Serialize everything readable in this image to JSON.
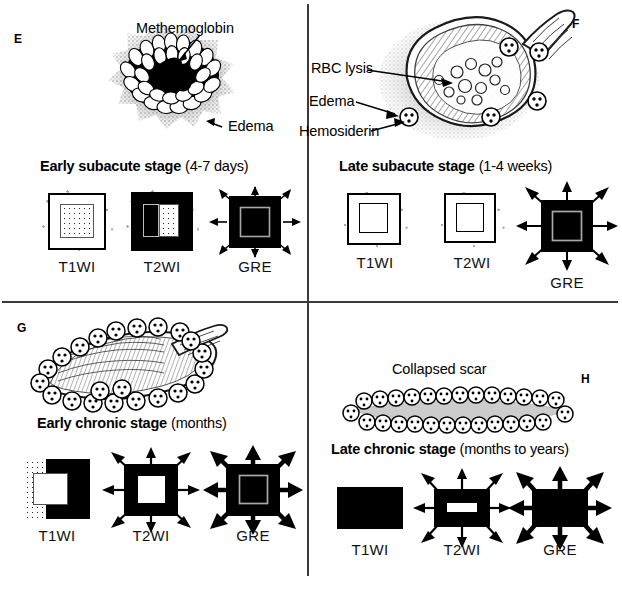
{
  "figure": {
    "panels": [
      {
        "letter": "E",
        "stage_bold": "Early subacute stage",
        "stage_light": "(4-7 days)",
        "annotations": [
          {
            "name": "methemoglobin",
            "text": "Methemoglobin"
          },
          {
            "name": "edema",
            "text": "Edema"
          }
        ],
        "sequences": [
          {
            "label": "T1WI",
            "appearance": "bright-core-dotted-with-edema-halo"
          },
          {
            "label": "T2WI",
            "appearance": "dark-with-bright-rim-and-edema-halo"
          },
          {
            "label": "GRE",
            "appearance": "black-square-with-grey-inner-thin-arrows"
          }
        ]
      },
      {
        "letter": "F",
        "stage_bold": "Late subacute stage",
        "stage_light": "(1-4 weeks)",
        "annotations": [
          {
            "name": "rbc-lysis",
            "text": "RBC lysis"
          },
          {
            "name": "edema",
            "text": "Edema"
          },
          {
            "name": "hemosiderin",
            "text": "Hemosiderin"
          }
        ],
        "sequences": [
          {
            "label": "T1WI",
            "appearance": "white-square-outlined-inner-square-edema-halo"
          },
          {
            "label": "T2WI",
            "appearance": "white-square-outlined-inner-square-edema-halo"
          },
          {
            "label": "GRE",
            "appearance": "black-square-grey-inner-thin-arrows"
          }
        ]
      },
      {
        "letter": "G",
        "stage_bold": "Early chronic stage",
        "stage_light": "(months)",
        "annotations": [],
        "sequences": [
          {
            "label": "T1WI",
            "appearance": "half-dotted-half-black-white-core"
          },
          {
            "label": "T2WI",
            "appearance": "black-square-white-core-thin-arrows"
          },
          {
            "label": "GRE",
            "appearance": "black-square-grey-core-bold-arrows"
          }
        ]
      },
      {
        "letter": "H",
        "stage_bold": "Late chronic stage",
        "stage_light": "(months to years)",
        "annotations": [
          {
            "name": "collapsed-scar",
            "text": "Collapsed scar"
          }
        ],
        "sequences": [
          {
            "label": "T1WI",
            "appearance": "solid-black-rectangle"
          },
          {
            "label": "T2WI",
            "appearance": "black-rectangle-white-slit-thin-arrows"
          },
          {
            "label": "GRE",
            "appearance": "solid-black-rectangle-bold-arrows"
          }
        ]
      }
    ]
  },
  "colors": {
    "ink": "#000000",
    "paper": "#ffffff",
    "divider": "#3a3a3a",
    "edema_stipple": "#6b6b6b",
    "grey_rim": "#9a9a9a"
  }
}
